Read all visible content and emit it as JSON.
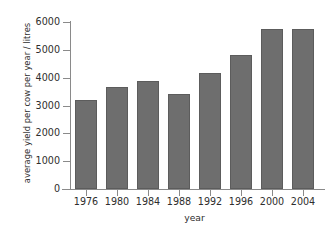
{
  "chart_data": {
    "type": "bar",
    "title": "",
    "xlabel": "year",
    "ylabel": "average yield per cow per year / litres",
    "categories": [
      "1976",
      "1980",
      "1984",
      "1988",
      "1992",
      "1996",
      "2000",
      "2004"
    ],
    "values": [
      3200,
      3680,
      3880,
      3400,
      4160,
      4820,
      5750,
      5760
    ],
    "ylim": [
      0,
      6000
    ],
    "yticks": [
      0,
      1000,
      2000,
      3000,
      4000,
      5000,
      6000
    ],
    "ytick_labels": [
      "0",
      "1000",
      "2000",
      "3000",
      "4000",
      "5000",
      "6000"
    ],
    "grid": false,
    "legend": null,
    "bar_color": "#6e6e6e",
    "bar_edge_color": "#5c5c5c",
    "axis_color": "#8a8a8a",
    "background_color": "#ffffff",
    "series": [
      {
        "name": "average yield per cow per year / litres",
        "values": [
          3200,
          3680,
          3880,
          3400,
          4160,
          4820,
          5750,
          5760
        ]
      }
    ]
  }
}
